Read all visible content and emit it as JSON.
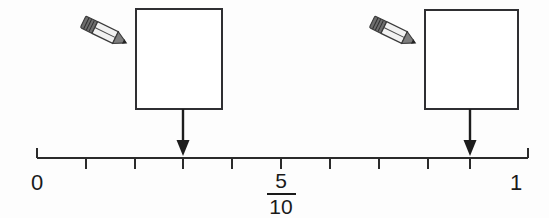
{
  "worksheet": {
    "title": "Number line with tenths",
    "background_color": "#fdfdfd",
    "ink_color": "#1a1a1a"
  },
  "number_line": {
    "start_label": "0",
    "end_label": "1",
    "midpoint_label": {
      "numerator": "5",
      "denominator": "10"
    },
    "divisions": 10,
    "tick_count": 11,
    "axis": {
      "x_start": 37,
      "x_end": 528,
      "y_baseline": 158
    }
  },
  "markers": [
    {
      "id": "marker-left",
      "pointer_x": 183,
      "tick_index": 3,
      "answer_box": {
        "value": "",
        "placeholder": "",
        "x": 136,
        "y": 9,
        "width": 86,
        "height": 100
      },
      "pencil_icon": "pencil-icon"
    },
    {
      "id": "marker-right",
      "pointer_x": 470,
      "tick_index": 9,
      "answer_box": {
        "value": "",
        "placeholder": "",
        "x": 425,
        "y": 10,
        "width": 93,
        "height": 99
      },
      "pencil_icon": "pencil-icon"
    }
  ]
}
